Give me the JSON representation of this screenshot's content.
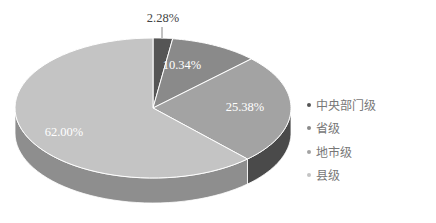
{
  "chart_data": {
    "type": "pie",
    "style": "3d",
    "title": "",
    "categories": [
      "中央部门级",
      "省级",
      "地市级",
      "县级"
    ],
    "values": [
      2.28,
      10.34,
      25.38,
      62.0
    ],
    "labels": [
      "2.28%",
      "10.34%",
      "25.38%",
      "62.00%"
    ],
    "colors": [
      "#555555",
      "#8a8a8a",
      "#a3a3a3",
      "#c4c4c4"
    ],
    "legend_position": "right"
  },
  "legend": {
    "items": [
      {
        "label": "中央部门级",
        "color": "#555555"
      },
      {
        "label": "省级",
        "color": "#8a8a8a"
      },
      {
        "label": "地市级",
        "color": "#a3a3a3"
      },
      {
        "label": "县级",
        "color": "#c4c4c4"
      }
    ]
  }
}
